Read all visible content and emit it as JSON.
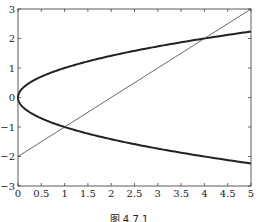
{
  "chart_data": {
    "type": "line",
    "title": "",
    "caption": "图 4.7.1",
    "xlabel": "",
    "ylabel": "",
    "xlim": [
      0,
      5
    ],
    "ylim": [
      -3,
      3
    ],
    "grid": false,
    "x_ticks": [
      "0",
      "0.5",
      "1",
      "1.5",
      "2",
      "2.5",
      "3",
      "3.5",
      "4",
      "4.5",
      "5"
    ],
    "y_ticks": [
      "3",
      "2",
      "1",
      "0",
      "-1",
      "-2",
      "-3"
    ],
    "series": [
      {
        "name": "parabola x = y^2 (y^2 = x)",
        "style": "thick",
        "color": "#222222",
        "x": [
          5,
          4,
          3,
          2,
          1,
          0.5,
          0.25,
          0,
          0.25,
          0.5,
          1,
          2,
          3,
          4,
          5
        ],
        "y": [
          2.236,
          2,
          1.732,
          1.414,
          1,
          0.707,
          0.5,
          0,
          -0.5,
          -0.707,
          -1,
          -1.414,
          -1.732,
          -2,
          -2.236
        ]
      },
      {
        "name": "line y = x - 2",
        "style": "thin",
        "color": "#444444",
        "x": [
          0,
          5
        ],
        "y": [
          -2,
          3
        ]
      }
    ],
    "intersections": [
      [
        1,
        -1
      ],
      [
        4,
        2
      ]
    ]
  }
}
